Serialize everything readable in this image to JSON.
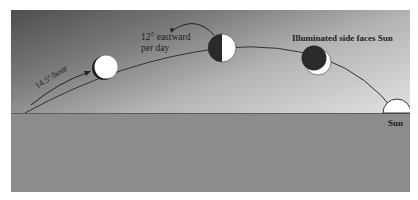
{
  "diagram": {
    "labels": {
      "hourly_rate": "14.5°/hour",
      "daily_shift_line1": "12° eastward",
      "daily_shift_line2": "per day",
      "illumination_note": "Illuminated side faces Sun",
      "sun": "Sun"
    },
    "moons": [
      {
        "id": "moon-1",
        "phase": "waning-crescent-edge",
        "lit_fraction": 0.9
      },
      {
        "id": "moon-2",
        "phase": "quarter",
        "lit_fraction": 0.5
      },
      {
        "id": "moon-3",
        "phase": "crescent",
        "lit_fraction": 0.2
      }
    ],
    "colors": {
      "sky_dark": "#4e4e4e",
      "sky_light": "#e2e2e2",
      "ground": "#8c8c8c",
      "horizon": "#5c5c5c",
      "moon_lit": "#ffffff",
      "moon_dark": "#2a2a2a",
      "arc": "#333333"
    }
  }
}
